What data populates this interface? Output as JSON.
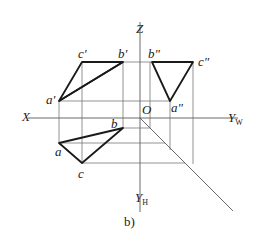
{
  "figure": {
    "caption": "b)",
    "axes": {
      "z_label": "Z",
      "x_label": "X",
      "origin_label": "O",
      "yw_label": "Y",
      "yw_sub": "W",
      "yh_label": "Y",
      "yh_sub": "H"
    },
    "front_view": {
      "points": [
        {
          "name": "a'",
          "x": 59,
          "y": 101
        },
        {
          "name": "b'",
          "x": 123,
          "y": 62
        },
        {
          "name": "c'",
          "x": 82,
          "y": 62
        }
      ]
    },
    "side_view": {
      "points": [
        {
          "name": "a\"",
          "x": 170,
          "y": 101
        },
        {
          "name": "b\"",
          "x": 150,
          "y": 62
        },
        {
          "name": "c\"",
          "x": 193,
          "y": 62
        }
      ]
    },
    "top_view": {
      "points": [
        {
          "name": "a",
          "x": 59,
          "y": 143
        },
        {
          "name": "b",
          "x": 123,
          "y": 128
        },
        {
          "name": "c",
          "x": 82,
          "y": 163
        }
      ]
    },
    "colors": {
      "line": "#222222",
      "construction": "#555555",
      "background": "#ffffff"
    }
  }
}
